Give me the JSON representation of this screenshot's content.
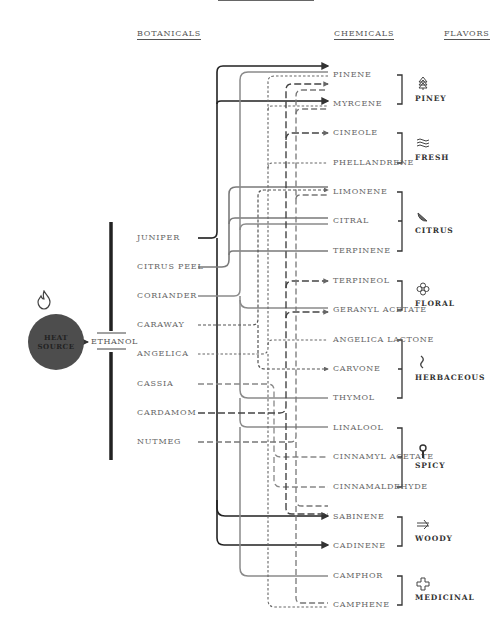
{
  "columns": {
    "botanicals": "BOTANICALS",
    "chemicals": "CHEMICALS",
    "flavors": "FLAVORS"
  },
  "source": {
    "heat_line1": "HEAT",
    "heat_line2": "SOURCE",
    "solvent": "ETHANOL",
    "icon": "flame-icon"
  },
  "botanicals": [
    {
      "label": "JUNIPER",
      "y": 238
    },
    {
      "label": "CITRUS PEEL",
      "y": 267
    },
    {
      "label": "CORIANDER",
      "y": 296
    },
    {
      "label": "CARAWAY",
      "y": 325
    },
    {
      "label": "ANGELICA",
      "y": 354
    },
    {
      "label": "CASSIA",
      "y": 384
    },
    {
      "label": "CARDAMOM",
      "y": 413
    },
    {
      "label": "NUTMEG",
      "y": 442
    }
  ],
  "chemicals": [
    {
      "label": "PINENE",
      "y": 75
    },
    {
      "label": "MYRCENE",
      "y": 104
    },
    {
      "label": "CINEOLE",
      "y": 133
    },
    {
      "label": "PHELLANDRENE",
      "y": 163
    },
    {
      "label": "LIMONENE",
      "y": 192
    },
    {
      "label": "CITRAL",
      "y": 221
    },
    {
      "label": "TERPINENE",
      "y": 251
    },
    {
      "label": "TERPINEOL",
      "y": 281
    },
    {
      "label": "GERANYL ACETATE",
      "y": 310
    },
    {
      "label": "ANGELICA LACTONE",
      "y": 340
    },
    {
      "label": "CARVONE",
      "y": 369
    },
    {
      "label": "THYMOL",
      "y": 398
    },
    {
      "label": "LINALOOL",
      "y": 428
    },
    {
      "label": "CINNAMYL ACETATE",
      "y": 457
    },
    {
      "label": "CINNAMALDEHYDE",
      "y": 487
    },
    {
      "label": "SABINENE",
      "y": 517
    },
    {
      "label": "CADINENE",
      "y": 546
    },
    {
      "label": "CAMPHOR",
      "y": 576
    },
    {
      "label": "CAMPHENE",
      "y": 605
    }
  ],
  "flavors": [
    {
      "label": "PINEY",
      "icon": "pine-tree-icon",
      "y": 98
    },
    {
      "label": "FRESH",
      "icon": "waves-icon",
      "y": 157
    },
    {
      "label": "CITRUS",
      "icon": "citrus-slice-icon",
      "y": 230
    },
    {
      "label": "FLORAL",
      "icon": "flower-icon",
      "y": 303
    },
    {
      "label": "HERBACEOUS",
      "icon": "herb-sprig-icon",
      "y": 377
    },
    {
      "label": "SPICY",
      "icon": "spice-grinder-icon",
      "y": 465
    },
    {
      "label": "WOODY",
      "icon": "log-icon",
      "y": 538
    },
    {
      "label": "MEDICINAL",
      "icon": "medical-cross-icon",
      "y": 597
    }
  ],
  "colors": {
    "juniper": "#222222",
    "citrus_coriander": "#777777",
    "dashed": "#666666",
    "heat": "#4d4d4d",
    "text": "#666666"
  }
}
